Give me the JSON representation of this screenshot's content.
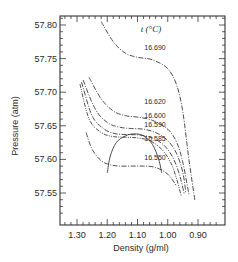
{
  "chart_data": {
    "type": "line",
    "title": "",
    "xlabel": "Density (g/ml)",
    "ylabel": "Pressure (atm)",
    "xlim": [
      1.33,
      0.875
    ],
    "ylim": [
      57.515,
      57.815
    ],
    "x_reversed": true,
    "grid": false,
    "legend_title": "t (°C)",
    "legend_placement": "inline-labels",
    "xticks": [
      1.3,
      1.2,
      1.1,
      1.0,
      0.9
    ],
    "xtick_labels": [
      "1.30",
      "1.20",
      "1.10",
      "1.00",
      "0.90"
    ],
    "yticks": [
      57.8,
      57.75,
      57.7,
      57.65,
      57.6,
      57.55
    ],
    "ytick_labels": [
      "57.80",
      "57.75",
      "57.70",
      "57.65",
      "57.60",
      "57.55"
    ],
    "series": [
      {
        "name": "16.690",
        "dash": "dash-dot",
        "x": [
          1.22,
          1.18,
          1.14,
          1.1,
          1.05,
          1.0,
          0.97,
          0.95,
          0.93,
          0.91
        ],
        "y": [
          57.805,
          57.775,
          57.758,
          57.752,
          57.748,
          57.735,
          57.71,
          57.67,
          57.6,
          57.538
        ]
      },
      {
        "name": "16.620",
        "dash": "dash-dot",
        "x": [
          1.26,
          1.22,
          1.18,
          1.14,
          1.1,
          1.05,
          1.0,
          0.97,
          0.95,
          0.93
        ],
        "y": [
          57.722,
          57.69,
          57.672,
          57.665,
          57.663,
          57.658,
          57.645,
          57.625,
          57.595,
          57.548
        ]
      },
      {
        "name": "16.600",
        "dash": "dash-dot",
        "x": [
          1.28,
          1.24,
          1.2,
          1.16,
          1.12,
          1.08,
          1.04,
          1.0,
          0.97,
          0.95,
          0.94
        ],
        "y": [
          57.718,
          57.675,
          57.655,
          57.648,
          57.646,
          57.645,
          57.64,
          57.628,
          57.608,
          57.58,
          57.55
        ]
      },
      {
        "name": "16.590",
        "dash": "dash-dot",
        "x": [
          1.285,
          1.25,
          1.21,
          1.17,
          1.13,
          1.09,
          1.05,
          1.01,
          0.98,
          0.96,
          0.945
        ],
        "y": [
          57.715,
          57.665,
          57.645,
          57.638,
          57.637,
          57.636,
          57.632,
          57.62,
          57.6,
          57.575,
          57.548
        ]
      },
      {
        "name": "16.585",
        "dash": "dash-dot-dot",
        "x": [
          1.29,
          1.26,
          1.22,
          1.18,
          1.14,
          1.1,
          1.06,
          1.02,
          0.99,
          0.97,
          0.955
        ],
        "y": [
          57.712,
          57.66,
          57.64,
          57.634,
          57.633,
          57.632,
          57.628,
          57.615,
          57.595,
          57.57,
          57.545
        ]
      },
      {
        "name": "16.550",
        "dash": "dash-dot",
        "x": [
          1.27,
          1.25,
          1.22,
          1.19,
          1.16,
          1.12,
          1.08,
          1.04,
          1.0,
          0.97
        ],
        "y": [
          57.64,
          57.615,
          57.598,
          57.592,
          57.59,
          57.59,
          57.59,
          57.588,
          57.578,
          57.56
        ]
      },
      {
        "name": "coexistence",
        "dash": "solid",
        "x": [
          1.2,
          1.19,
          1.17,
          1.14,
          1.11,
          1.08,
          1.05,
          1.03,
          1.02
        ],
        "y": [
          57.58,
          57.605,
          57.625,
          57.635,
          57.638,
          57.635,
          57.622,
          57.6,
          57.58
        ]
      }
    ],
    "annotations": [
      "16.690",
      "16.620",
      "16.600",
      "16.590",
      "16.585",
      "16.550"
    ]
  }
}
